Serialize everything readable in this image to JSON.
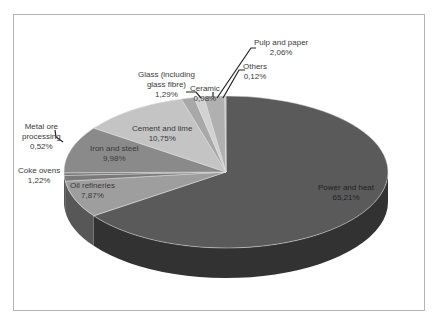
{
  "chart_data": {
    "type": "pie",
    "title": "",
    "style": "3d-exploded-none",
    "legend": "none",
    "categories": [
      "Power and heat",
      "Oil refineries",
      "Coke ovens",
      "Metal ore processing",
      "Iron and steel",
      "Cement and lime",
      "Glass (including glass fibre)",
      "Ceramic",
      "Pulp and paper",
      "Others"
    ],
    "values": [
      65.21,
      7.87,
      1.22,
      0.52,
      9.98,
      10.75,
      1.29,
      0.98,
      2.06,
      0.12
    ],
    "value_labels": [
      "65,21%",
      "7,87%",
      "1,22%",
      "0,52%",
      "9,98%",
      "10,75%",
      "1,29%",
      "0,98%",
      "2,06%",
      "0,12%"
    ],
    "colors": [
      "#5a5a5a",
      "#9e9e9e",
      "#7a7a7a",
      "#6e6e6e",
      "#8a8a8a",
      "#c4c4c4",
      "#a8a8a8",
      "#d2d2d2",
      "#b0b0b0",
      "#bcbcbc"
    ]
  },
  "labels": {
    "power": {
      "name": "Power and heat",
      "value": "65,21%"
    },
    "oil": {
      "name": "Oil refineries",
      "value": "7,87%"
    },
    "coke": {
      "name": "Coke ovens",
      "value": "1,22%"
    },
    "metal": {
      "name1": "Metal ore",
      "name2": "processing",
      "value": "0,52%"
    },
    "iron": {
      "name": "Iron and steel",
      "value": "9,98%"
    },
    "cement": {
      "name": "Cement and lime",
      "value": "10,75%"
    },
    "glass": {
      "name1": "Glass (including",
      "name2": "glass fibre)",
      "value": "1,29%"
    },
    "ceramic": {
      "name": "Ceramic",
      "value": "0,98%"
    },
    "pulp": {
      "name": "Pulp and paper",
      "value": "2,06%"
    },
    "others": {
      "name": "Others",
      "value": "0,12%"
    }
  }
}
